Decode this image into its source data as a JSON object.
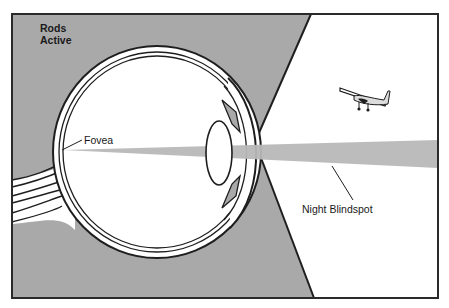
{
  "diagram": {
    "labels": {
      "rods_active_line1": "Rods",
      "rods_active_line2": "Active",
      "fovea": "Fovea",
      "night_blindspot": "Night Blindspot"
    },
    "colors": {
      "background": "#ffffff",
      "rod_region_gray": "#a9a9a9",
      "light_beam_gray": "#b8b8b8",
      "outline": "#1e1e1e"
    },
    "icons": {
      "airplane": "airplane-icon"
    }
  }
}
